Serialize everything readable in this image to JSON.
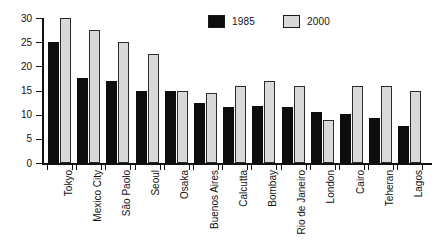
{
  "chart_data": {
    "type": "bar",
    "title": "",
    "xlabel": "",
    "ylabel": "",
    "ylim": [
      0,
      30
    ],
    "yticks": [
      0,
      5,
      10,
      15,
      20,
      25,
      30
    ],
    "grid": false,
    "legend_position": "top-right",
    "categories": [
      "Tokyo",
      "Mexico City",
      "São Paolo",
      "Seoul",
      "Osaka",
      "Buenos Aires",
      "Calcutta",
      "Bombay",
      "Rio de Janeiro",
      "London",
      "Cairo",
      "Teheran",
      "Lagos"
    ],
    "series": [
      {
        "name": "1985",
        "color": "#0d0d0d",
        "values": [
          25,
          17.5,
          17,
          15,
          15,
          12.5,
          11.5,
          11.7,
          11.5,
          10.5,
          10.2,
          9.3,
          7.7
        ]
      },
      {
        "name": "2000",
        "color": "#d9d9d9",
        "values": [
          30,
          27.5,
          25,
          22.5,
          15,
          14.5,
          16,
          17,
          16,
          9,
          16,
          16,
          15
        ]
      }
    ]
  },
  "legend": {
    "entries": [
      {
        "label": "1985",
        "swatch": "black-filled-square"
      },
      {
        "label": "2000",
        "swatch": "light-gray-square"
      }
    ]
  }
}
